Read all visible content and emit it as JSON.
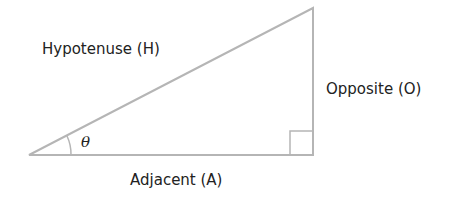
{
  "diagram": {
    "labels": {
      "hypotenuse": "Hypotenuse (H)",
      "opposite": "Opposite (O)",
      "adjacent": "Adjacent (A)",
      "angle": "θ"
    },
    "colors": {
      "stroke": "#b5b5b5",
      "text": "#222222"
    }
  }
}
